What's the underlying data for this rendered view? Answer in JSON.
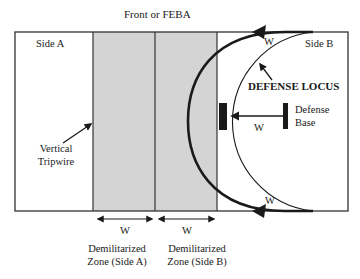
{
  "title": "Front or FEBA",
  "sides": {
    "a": "Side A",
    "b": "Side B"
  },
  "labels": {
    "defense_locus": "DEFENSE LOCUS",
    "defense_base_line1": "Defense",
    "defense_base_line2": "Base",
    "tripwire_line1": "Vertical",
    "tripwire_line2": "Tripwire",
    "w_top": "W",
    "w_middle": "W",
    "w_bottom": "W",
    "w_dmz_a": "W",
    "w_dmz_b": "W"
  },
  "zones": [
    {
      "line1": "Demilitarized",
      "line2": "Zone (Side A)",
      "fill": "#d4d4d4"
    },
    {
      "line1": "Demilitarized",
      "line2": "Zone (Side B)",
      "fill": "#d4d4d4"
    }
  ],
  "colors": {
    "stroke": "#1a1a1a",
    "zone_fill": "#d4d4d4",
    "background": "#ffffff"
  }
}
